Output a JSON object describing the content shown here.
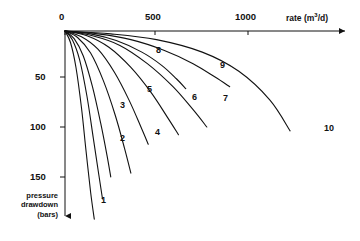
{
  "chart_data": {
    "type": "line",
    "title": "",
    "xlabel": "rate (m3/d)",
    "xlabel_main": "rate (m",
    "xlabel_sup": "3",
    "xlabel_tail": "/d)",
    "ylabel_line1": "pressure",
    "ylabel_line2": "drawdown",
    "ylabel_line3": "(bars)",
    "xticks": [
      0,
      500,
      1000
    ],
    "xtick_labels": [
      "0",
      "500",
      "1000"
    ],
    "yticks": [
      50,
      100,
      150
    ],
    "ytick_labels": [
      "50",
      "100",
      "150"
    ],
    "xlim": [
      0,
      1320
    ],
    "ylim": [
      0,
      215
    ],
    "y_axis_inverted": true,
    "grid": false,
    "legend": "none",
    "curve_labels": [
      "1",
      "2",
      "3",
      "4",
      "5",
      "6",
      "7",
      "8",
      "9",
      "10"
    ],
    "series": [
      {
        "name": "1",
        "x": [
          0,
          30,
          60,
          90,
          115,
          140,
          160
        ],
        "y": [
          0,
          12,
          38,
          80,
          125,
          168,
          196
        ]
      },
      {
        "name": "2",
        "x": [
          0,
          40,
          80,
          120,
          155,
          185,
          205
        ],
        "y": [
          0,
          9,
          30,
          68,
          112,
          150,
          175
        ]
      },
      {
        "name": "3",
        "x": [
          0,
          50,
          100,
          150,
          195,
          230,
          250
        ],
        "y": [
          0,
          8,
          26,
          58,
          96,
          130,
          152
        ]
      },
      {
        "name": "4",
        "x": [
          0,
          70,
          140,
          210,
          275,
          325,
          360
        ],
        "y": [
          0,
          7,
          23,
          52,
          88,
          122,
          148
        ]
      },
      {
        "name": "5",
        "x": [
          0,
          90,
          180,
          270,
          350,
          415,
          455
        ],
        "y": [
          0,
          6,
          19,
          43,
          72,
          100,
          118
        ]
      },
      {
        "name": "6",
        "x": [
          0,
          120,
          240,
          360,
          470,
          560,
          620
        ],
        "y": [
          0,
          5,
          17,
          38,
          64,
          90,
          108
        ]
      },
      {
        "name": "7",
        "x": [
          0,
          150,
          300,
          450,
          590,
          700,
          775
        ],
        "y": [
          0,
          5,
          15,
          34,
          58,
          82,
          100
        ]
      },
      {
        "name": "8",
        "x": [
          0,
          140,
          280,
          420,
          530,
          610,
          660
        ],
        "y": [
          0,
          3,
          10,
          22,
          36,
          50,
          60
        ]
      },
      {
        "name": "9",
        "x": [
          0,
          180,
          360,
          540,
          700,
          820,
          900
        ],
        "y": [
          0,
          3,
          9,
          20,
          34,
          48,
          58
        ]
      },
      {
        "name": "10",
        "x": [
          0,
          250,
          500,
          750,
          950,
          1120,
          1230
        ],
        "y": [
          0,
          3,
          9,
          22,
          42,
          72,
          104
        ]
      }
    ],
    "label_positions": [
      {
        "name": "1",
        "px": 101,
        "py": 196
      },
      {
        "name": "2",
        "px": 120,
        "py": 134
      },
      {
        "name": "3",
        "px": 120,
        "py": 101
      },
      {
        "name": "4",
        "px": 155,
        "py": 128
      },
      {
        "name": "5",
        "px": 147,
        "py": 85
      },
      {
        "name": "6",
        "px": 192,
        "py": 93
      },
      {
        "name": "7",
        "px": 223,
        "py": 94
      },
      {
        "name": "8",
        "px": 156,
        "py": 46
      },
      {
        "name": "9",
        "px": 220,
        "py": 61
      },
      {
        "name": "10",
        "px": 324,
        "py": 124
      }
    ],
    "axis_color": "#111111",
    "curve_color": "#111111"
  }
}
